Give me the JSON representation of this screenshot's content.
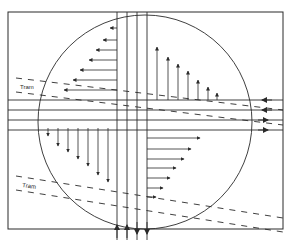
{
  "diagram": {
    "type": "traffic-intersection-velocity-field",
    "colors": {
      "stroke": "#2a2a2a",
      "background": "#ffffff"
    },
    "frame": {
      "x": 8,
      "y": 12,
      "w": 275,
      "h": 217
    },
    "circle": {
      "cx": 145,
      "cy": 122,
      "r": 107
    },
    "vertical_lanes_x": [
      117,
      127,
      137,
      147
    ],
    "horizontal_lanes_y": [
      100,
      110,
      120,
      130
    ],
    "labels": {
      "tram_upper": "Tram",
      "tram_lower": "Tram"
    },
    "quadrant_arrows": {
      "top_left_leftward": {
        "y": [
          28,
          40,
          52,
          64,
          76,
          88
        ],
        "x_end": [
          107,
          102,
          96,
          90,
          84,
          78
        ]
      },
      "top_right_upward": {
        "x": [
          157,
          167,
          177,
          187,
          197,
          207,
          217
        ],
        "y_end": [
          45,
          55,
          62,
          70,
          80,
          87,
          93
        ]
      },
      "bottom_left_downward": {
        "x": [
          48,
          58,
          68,
          78,
          88,
          98,
          108
        ],
        "y_end": [
          135,
          146,
          152,
          160,
          165,
          172,
          178
        ]
      },
      "bottom_right_rightward": {
        "y": [
          138,
          148,
          158,
          168,
          178,
          188,
          198
        ],
        "x_end": [
          200,
          190,
          184,
          178,
          170,
          164,
          156
        ]
      }
    },
    "lane_end_arrows": {
      "horizontal": [
        "left",
        "left",
        "right",
        "right"
      ],
      "vertical": [
        "up",
        "up",
        "down",
        "down"
      ]
    }
  }
}
